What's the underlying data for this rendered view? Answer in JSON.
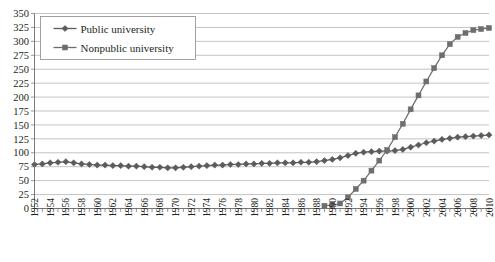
{
  "chart_data": {
    "type": "line",
    "title": "",
    "xlabel": "",
    "ylabel": "",
    "ylim": [
      0,
      350
    ],
    "ytick_step": 25,
    "yticks": [
      0,
      25,
      50,
      75,
      100,
      125,
      150,
      175,
      200,
      225,
      250,
      275,
      300,
      325,
      350
    ],
    "grid": true,
    "legend_position": "top-left",
    "x": [
      1952,
      1953,
      1954,
      1955,
      1956,
      1957,
      1958,
      1959,
      1960,
      1961,
      1962,
      1963,
      1964,
      1965,
      1966,
      1967,
      1968,
      1969,
      1970,
      1971,
      1972,
      1973,
      1974,
      1975,
      1976,
      1977,
      1978,
      1979,
      1980,
      1981,
      1982,
      1983,
      1984,
      1985,
      1986,
      1987,
      1988,
      1989,
      1990,
      1991,
      1992,
      1993,
      1994,
      1995,
      1996,
      1997,
      1998,
      1999,
      2000,
      2001,
      2002,
      2003,
      2004,
      2005,
      2006,
      2007,
      2008,
      2009,
      2010
    ],
    "xtick_labels": [
      "1952",
      "1954",
      "1956",
      "1958",
      "1960",
      "1962",
      "1964",
      "1966",
      "1968",
      "1970",
      "1972",
      "1974",
      "1976",
      "1978",
      "1980",
      "1982",
      "1984",
      "1986",
      "1988",
      "1990",
      "1992",
      "1994",
      "1996",
      "1998",
      "2000",
      "2002",
      "2004",
      "2006",
      "2008",
      "2010"
    ],
    "series": [
      {
        "name": "Public university",
        "marker": "diamond",
        "color": "#5b5b5b",
        "values": [
          79,
          80,
          82,
          83,
          84,
          82,
          80,
          79,
          78,
          78,
          77,
          77,
          76,
          76,
          75,
          74,
          74,
          73,
          73,
          74,
          75,
          76,
          77,
          78,
          78,
          79,
          79,
          80,
          80,
          81,
          81,
          82,
          82,
          82,
          83,
          83,
          84,
          86,
          88,
          91,
          95,
          99,
          101,
          102,
          103,
          103,
          104,
          106,
          110,
          114,
          118,
          121,
          124,
          126,
          128,
          129,
          130,
          131,
          132
        ]
      },
      {
        "name": "Nonpublic university",
        "marker": "square",
        "color": "#6e6e6e",
        "values": [
          null,
          null,
          null,
          null,
          null,
          null,
          null,
          null,
          null,
          null,
          null,
          null,
          null,
          null,
          null,
          null,
          null,
          null,
          null,
          null,
          null,
          null,
          null,
          null,
          null,
          null,
          null,
          null,
          null,
          null,
          null,
          null,
          null,
          null,
          null,
          null,
          null,
          5,
          6,
          9,
          20,
          35,
          50,
          68,
          86,
          105,
          128,
          152,
          178,
          203,
          228,
          252,
          275,
          295,
          308,
          315,
          320,
          322,
          324
        ]
      }
    ]
  },
  "legend": {
    "items": [
      {
        "label": "Public university",
        "marker": "diamond"
      },
      {
        "label": "Nonpublic university",
        "marker": "square"
      }
    ]
  },
  "colors": {
    "public": "#5b5b5b",
    "nonpublic": "#6e6e6e",
    "grid": "#9a9a9a",
    "axis": "#6d6d6d",
    "text": "#231f20"
  }
}
